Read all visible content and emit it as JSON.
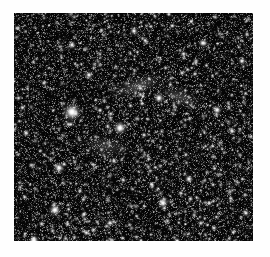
{
  "figure": {
    "kind": "astronomical-image",
    "caption_text": "",
    "background_color": "#fefefe"
  },
  "image_panel": {
    "name": "star-field",
    "frame": {
      "left": 14,
      "top": 13,
      "width": 239,
      "height": 228,
      "background_color": "#000000",
      "border": "none"
    },
    "render": {
      "sky_background_color": "#050505",
      "star_color": "#ffffff",
      "noise_grain_color": "#2a2a2a",
      "pixel_scale": 1,
      "seed": 20240117,
      "faint_star_count": 5200,
      "mid_star_count": 520,
      "grain_density": 0.46
    },
    "bright_stars": [
      {
        "x": 58,
        "y": 99,
        "radius": 5.6,
        "peak": 1.0,
        "label": "brightest-star"
      },
      {
        "x": 106,
        "y": 115,
        "radius": 4.2,
        "peak": 0.97,
        "label": "bright-star-center"
      },
      {
        "x": 41,
        "y": 197,
        "radius": 3.8,
        "peak": 0.95,
        "label": "bright-star-lower-left"
      },
      {
        "x": 45,
        "y": 155,
        "radius": 3.2,
        "peak": 0.9,
        "label": "bright-star-mid-left"
      },
      {
        "x": 20,
        "y": 228,
        "radius": 3.4,
        "peak": 0.93,
        "label": "bright-star-bottom-left-corner"
      },
      {
        "x": 145,
        "y": 85,
        "radius": 3.2,
        "peak": 0.9,
        "label": "bright-star-upper-right"
      },
      {
        "x": 149,
        "y": 190,
        "radius": 3.4,
        "peak": 0.92,
        "label": "bright-star-lower-right"
      },
      {
        "x": 203,
        "y": 97,
        "radius": 3.0,
        "peak": 0.88,
        "label": "bright-star-right"
      },
      {
        "x": 175,
        "y": 166,
        "radius": 2.8,
        "peak": 0.85,
        "label": "bright-star-center-right"
      },
      {
        "x": 189,
        "y": 30,
        "radius": 2.8,
        "peak": 0.86,
        "label": "bright-star-top-right"
      },
      {
        "x": 120,
        "y": 18,
        "radius": 2.6,
        "peak": 0.84,
        "label": "bright-star-top-center"
      },
      {
        "x": 58,
        "y": 32,
        "radius": 2.6,
        "peak": 0.83,
        "label": "bright-star-top-left"
      },
      {
        "x": 75,
        "y": 62,
        "radius": 2.6,
        "peak": 0.82,
        "label": "bright-star-upper-left"
      },
      {
        "x": 228,
        "y": 48,
        "radius": 2.5,
        "peak": 0.82,
        "label": "bright-star-far-right-top"
      },
      {
        "x": 218,
        "y": 118,
        "radius": 2.4,
        "peak": 0.8,
        "label": "bright-star-far-right-mid"
      },
      {
        "x": 96,
        "y": 210,
        "radius": 2.4,
        "peak": 0.8,
        "label": "bright-star-bottom-center"
      },
      {
        "x": 232,
        "y": 200,
        "radius": 2.3,
        "peak": 0.78,
        "label": "bright-star-bottom-right"
      },
      {
        "x": 12,
        "y": 120,
        "radius": 2.3,
        "peak": 0.78,
        "label": "bright-star-left-edge"
      },
      {
        "x": 163,
        "y": 228,
        "radius": 2.2,
        "peak": 0.77,
        "label": "bright-star-bottom"
      },
      {
        "x": 100,
        "y": 148,
        "radius": 2.2,
        "peak": 0.76,
        "label": "bright-star-core-left"
      },
      {
        "x": 130,
        "y": 122,
        "radius": 2.0,
        "peak": 0.74,
        "label": "bright-star-core"
      },
      {
        "x": 200,
        "y": 215,
        "radius": 2.0,
        "peak": 0.73,
        "label": "bright-star-lower-far-right"
      },
      {
        "x": 30,
        "y": 70,
        "radius": 2.0,
        "peak": 0.72,
        "label": "bright-star-left-upper"
      },
      {
        "x": 168,
        "y": 60,
        "radius": 2.0,
        "peak": 0.72,
        "label": "bright-star-right-upper"
      },
      {
        "x": 66,
        "y": 178,
        "radius": 1.9,
        "peak": 0.7,
        "label": "bright-star-left-lower"
      }
    ],
    "diffuse_features": [
      {
        "cx": 124,
        "cy": 73,
        "rx": 17,
        "ry": 6,
        "rot": -18,
        "peak": 0.26,
        "label": "faint-arc-upper-center"
      },
      {
        "cx": 166,
        "cy": 84,
        "rx": 14,
        "ry": 6,
        "rot": 22,
        "peak": 0.22,
        "label": "faint-arc-upper-right"
      },
      {
        "cx": 92,
        "cy": 133,
        "rx": 15,
        "ry": 7,
        "rot": 8,
        "peak": 0.18,
        "label": "faint-nebulosity-center"
      }
    ]
  }
}
